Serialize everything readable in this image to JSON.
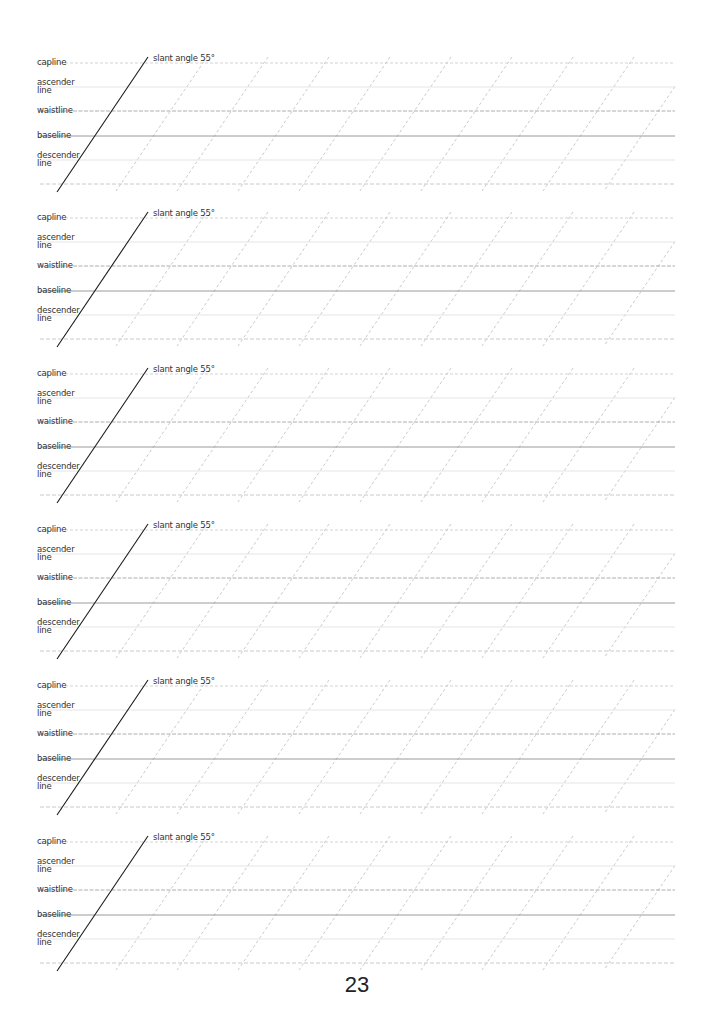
{
  "page": {
    "type": "calligraphy practice sheet",
    "page_number": "23"
  },
  "labels": {
    "capline": "capline",
    "ascender": "ascender\nline",
    "waistline": "waistline",
    "baseline": "baseline",
    "descender": "descender\nline",
    "slant": "slant angle 55°"
  },
  "guide": {
    "slant_angle_deg": 55,
    "blocks": 6,
    "block_tops": [
      63,
      218,
      374,
      530,
      686,
      842
    ],
    "line_offsets": [
      0,
      24,
      48,
      73,
      97,
      121
    ],
    "line_styles": [
      "capline",
      "ascender",
      "waistline",
      "baseline",
      "descender",
      "bottom"
    ],
    "line_x_start": 40,
    "line_x_end": 675,
    "slant_spacing": 61,
    "slant_first_top_x": 207,
    "solid_slant_top_x": 148,
    "slant_dx": 91,
    "colors": {
      "capline": "#c8c8c8",
      "ascender": "#dedede",
      "waistline": "#9a9a9a",
      "baseline": "#8e8e8e",
      "descender": "#dedede",
      "bottom": "#bdbdbd",
      "slant_dashed": "#b5b5b5",
      "slant_solid": "#1a1a1a"
    }
  }
}
